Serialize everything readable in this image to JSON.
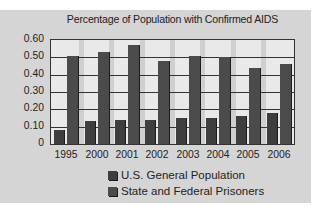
{
  "chart_data": {
    "type": "bar",
    "title": "Percentage of Population with Confirmed AIDS",
    "xlabel": "",
    "ylabel": "",
    "categories": [
      "1995",
      "2000",
      "2001",
      "2002",
      "2003",
      "2004",
      "2005",
      "2006"
    ],
    "series": [
      {
        "name": "U.S. General Population",
        "color": "#3e3e3e",
        "values": [
          0.08,
          0.13,
          0.14,
          0.14,
          0.15,
          0.15,
          0.16,
          0.18
        ]
      },
      {
        "name": "State and Federal Prisoners",
        "color": "#4b4b4b",
        "values": [
          0.51,
          0.53,
          0.57,
          0.48,
          0.51,
          0.5,
          0.44,
          0.46
        ]
      }
    ],
    "ylim": [
      0,
      0.6
    ],
    "yticks": [
      "0",
      "0.10",
      "0.20",
      "0.30",
      "0.40",
      "0.50",
      "0.60"
    ],
    "grid": true,
    "legend_position": "bottom"
  }
}
